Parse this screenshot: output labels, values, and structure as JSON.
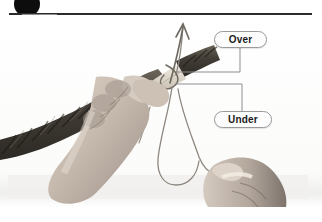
{
  "page": {
    "background_color": "#ffffff"
  },
  "header": {
    "step_number": "3",
    "badge_color": "#8e8e8e",
    "rule_color": "#2b2b2b",
    "dot_color": "#0d0d0d",
    "dot_name": "header-bullet"
  },
  "photo": {
    "alt": "Two hands wrapping whipping twine around a taped rope end; a long twine bight hangs down and an arrow points up along the standing part.",
    "rope_color": "#4a463f",
    "tape_color": "#d8d2c6",
    "skin_color": "#c9bdb2",
    "twine_color": "#9a948c",
    "arrow_color": "#6d6860",
    "plate_background": "#fbfbfb"
  },
  "callouts": [
    {
      "id": "over",
      "label": "Over",
      "border_color": "#9a9a9a",
      "text_color": "#1b1b1b"
    },
    {
      "id": "under",
      "label": "Under",
      "border_color": "#9a9a9a",
      "text_color": "#1b1b1b"
    }
  ],
  "leader_lines": {
    "color": "#8d8d8d",
    "over_target": "twine crossing over the rope",
    "under_target": "twine passing under the rope"
  }
}
